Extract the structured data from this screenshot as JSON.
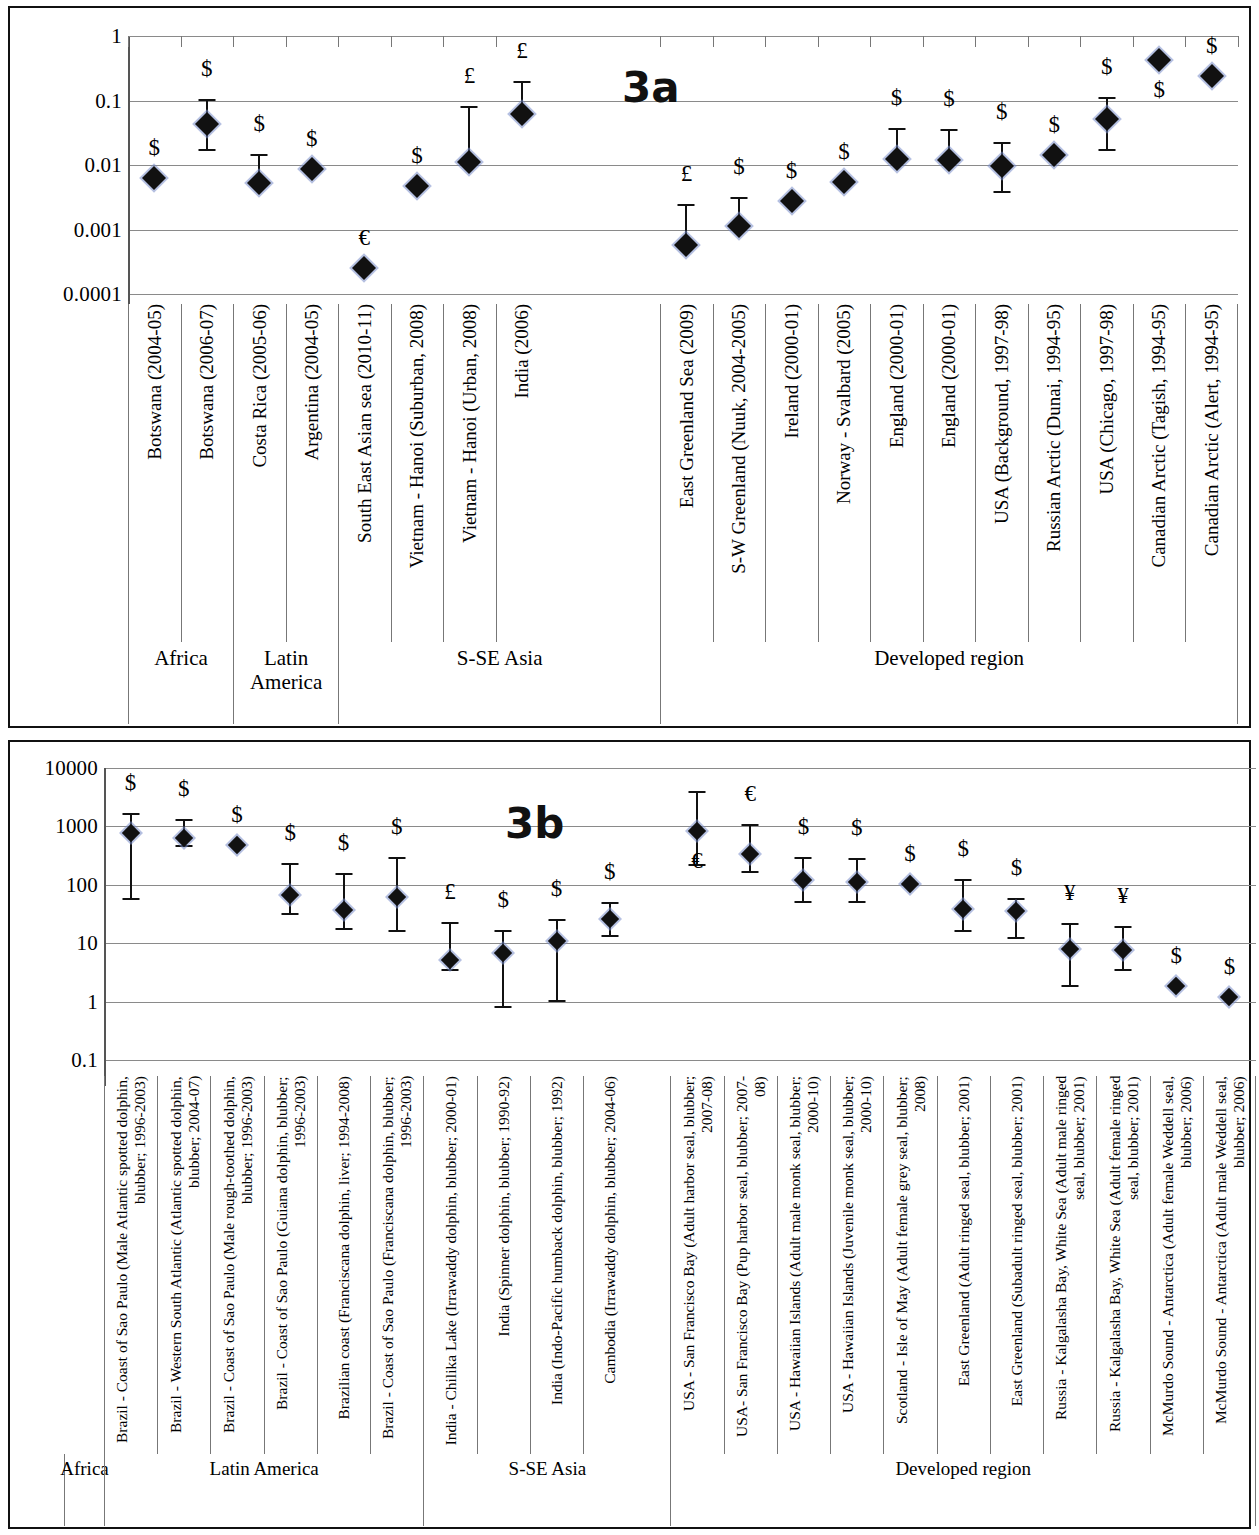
{
  "figure": {
    "panel_a_tag": "3a",
    "panel_b_tag": "3b"
  },
  "chart_data": [
    {
      "id": "3a",
      "type": "scatter",
      "title": "3a",
      "xlabel": "",
      "ylabel": "",
      "yscale": "log",
      "ylim": [
        0.0001,
        1
      ],
      "yticks": [
        "1",
        "0.1",
        "0.01",
        "0.001",
        "0.0001"
      ],
      "ytick_values": [
        1,
        0.1,
        0.01,
        0.001,
        0.0001
      ],
      "grid": true,
      "legend": "none",
      "categories": [
        "Botswana (2004-05)",
        "Botswana (2006-07)",
        "Costa Rica (2005-06)",
        "Argentina (2004-05)",
        "South East Asian sea (2010-11)",
        "Vietnam - Hanoi (Suburban, 2008)",
        "Vietnam - Hanoi (Urban, 2008)",
        "India (2006)",
        "East Greenland Sea (2009)",
        "S-W Greenland (Nuuk, 2004-2005)",
        "Ireland (2000-01)",
        "Norway - Svalbard (2005)",
        "England (2000-01)",
        "England (2000-01)",
        "USA (Background, 1997-98)",
        "Russian Arctic (Dunai, 1994-95)",
        "USA (Chicago, 1997-98)",
        "Canadian Arctic (Tagish, 1994-95)",
        "Canadian Arctic (Alert, 1994-95)"
      ],
      "values": [
        0.0063,
        0.043,
        0.0052,
        0.0086,
        0.00025,
        0.0047,
        0.011,
        0.062,
        0.00058,
        0.00115,
        0.0028,
        0.0054,
        0.0122,
        0.0118,
        0.0096,
        0.0145,
        0.052,
        0.42,
        0.24
      ],
      "err_low": [
        null,
        0.018,
        0.0052,
        null,
        null,
        null,
        0.011,
        0.062,
        0.00058,
        0.00115,
        null,
        null,
        0.0122,
        0.0118,
        0.004,
        0.0145,
        0.018,
        null,
        null
      ],
      "err_high": [
        null,
        0.105,
        0.015,
        null,
        null,
        null,
        0.082,
        0.2,
        0.0025,
        0.0032,
        null,
        null,
        0.037,
        0.036,
        0.023,
        null,
        0.115,
        null,
        null
      ],
      "currency_symbols": [
        "$",
        "$",
        "$",
        "$",
        "€",
        "$",
        "£",
        "£",
        "£",
        "$",
        "$",
        "$",
        "$",
        "$",
        "$",
        "$",
        "$",
        "$",
        "$"
      ],
      "region_groups": [
        {
          "label": "Africa",
          "start": 0,
          "end": 1
        },
        {
          "label": "Latin America",
          "start": 2,
          "end": 3
        },
        {
          "label": "S-SE Asia",
          "start": 4,
          "end": 7
        },
        {
          "label": "Developed region",
          "start": 8,
          "end": 18
        }
      ]
    },
    {
      "id": "3b",
      "type": "scatter",
      "title": "3b",
      "xlabel": "",
      "ylabel": "",
      "yscale": "log",
      "ylim": [
        0.1,
        10000
      ],
      "yticks": [
        "10000",
        "1000",
        "100",
        "10",
        "1",
        "0.1"
      ],
      "ytick_values": [
        10000,
        1000,
        100,
        10,
        1,
        0.1
      ],
      "grid": true,
      "legend": "none",
      "categories": [
        "Brazil - Coast of Sao Paulo (Male Atlantic spotted dolphin, blubber; 1996-2003)",
        "Brazil - Western South Atlantic (Atlantic spotted dolphin, blubber; 2004-07)",
        "Brazil - Coast of Sao Paulo (Male rough-toothed dolphin, blubber; 1996-2003)",
        "Brazil - Coast of Sao Paulo (Guiana dolphin, blubber; 1996-2003)",
        "Brazilian coast (Franciscana dolphin, liver; 1994-2008)",
        "Brazil - Coast of Sao Paulo (Franciscana dolphin, blubber; 1996-2003)",
        "India - Chilika Lake (Irrawaddy dolphin, blubber; 2000-01)",
        "India (Spinner dolphin, blubber; 1990-92)",
        "India (Indo-Pacific humback dolphin, blubber; 1992)",
        "Cambodia (Irrawaddy dolphin, blubber; 2004-06)",
        "USA - San Francisco Bay (Adult harbor seal, blubber; 2007-08)",
        "USA- San Francisco Bay (Pup harbor seal, blubber; 2007-08)",
        "USA - Hawaiian Islands (Adult male monk seal, blubber; 2000-10)",
        "USA - Hawaiian Islands (Juvenile monk seal, blubber; 2000-10)",
        "Scotland - Isle of May (Adult female grey seal, blubber; 2008)",
        "East Greenland (Adult ringed seal, blubber; 2001)",
        "East Greenland (Subadult ringed seal, blubber; 2001)",
        "Russia - Kalgalasha Bay, White Sea (Adult male ringed seal, blubber; 2001)",
        "Russia - Kalgalasha Bay, White Sea (Adult female ringed seal, blubber; 2001)",
        "McMurdo Sound - Antarctica (Adult female Weddell seal, blubber; 2006)",
        "McMurdo Sound - Antarctica (Adult male Weddell seal, blubber; 2006)"
      ],
      "values": [
        780,
        640,
        480,
        68,
        37,
        62,
        5.1,
        6.8,
        11,
        26,
        820,
        340,
        120,
        112,
        105,
        39,
        36,
        8.0,
        7.8,
        1.85,
        1.2
      ],
      "err_low": [
        60,
        480,
        null,
        33,
        18,
        17,
        3.6,
        0.85,
        1.05,
        14,
        230,
        170,
        52,
        52,
        null,
        17,
        13,
        1.9,
        3.6,
        null,
        null
      ],
      "err_high": [
        1700,
        1350,
        null,
        240,
        160,
        300,
        23,
        17,
        26,
        50,
        4100,
        1100,
        300,
        290,
        null,
        125,
        60,
        22,
        20,
        null,
        null
      ],
      "currency_symbols": [
        "$",
        "$",
        "$",
        "$",
        "$",
        "$",
        "£",
        "$",
        "$",
        "$",
        "€",
        "€",
        "$",
        "$",
        "$",
        "$",
        "$",
        "¥",
        "¥",
        "$",
        "$"
      ],
      "region_groups": [
        {
          "label": "Africa",
          "start": -1,
          "end": -1
        },
        {
          "label": "Latin America",
          "start": 0,
          "end": 5
        },
        {
          "label": "S-SE Asia",
          "start": 6,
          "end": 9
        },
        {
          "label": "Developed region",
          "start": 10,
          "end": 20
        }
      ]
    }
  ]
}
